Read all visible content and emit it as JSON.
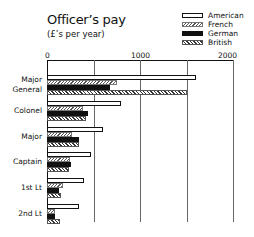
{
  "chart_data": {
    "type": "bar",
    "orientation": "horizontal",
    "subtitle": "(£'s per year)",
    "xlabel": "",
    "ylabel": "",
    "xlim": [
      0,
      2000
    ],
    "xticks": [
      0,
      1000,
      2000
    ],
    "x_gridlines": [
      500,
      1000,
      1500,
      2000
    ],
    "legend_position": "top-right",
    "categories": [
      "Major General",
      "Colonel",
      "Major",
      "Captain",
      "1st Lt",
      "2nd Lt"
    ],
    "series": [
      {
        "name": "American",
        "fill": "white",
        "values": [
          1600,
          800,
          600,
          470,
          400,
          340
        ]
      },
      {
        "name": "French",
        "fill": "light-hatch",
        "values": [
          750,
          390,
          270,
          250,
          170,
          90
        ]
      },
      {
        "name": "German",
        "fill": "black",
        "values": [
          680,
          440,
          340,
          260,
          130,
          90
        ]
      },
      {
        "name": "British",
        "fill": "dark-hatch",
        "values": [
          1500,
          420,
          340,
          240,
          150,
          140
        ]
      }
    ]
  },
  "labels": {
    "title": "Officer’s pay",
    "subtitle": "(£’s per year)",
    "ticks": [
      "0",
      "1000",
      "2000"
    ],
    "categories": [
      "Major\nGeneral",
      "Colonel",
      "Major",
      "Captain",
      "1st Lt",
      "2nd Lt"
    ],
    "legend": [
      "American",
      "French",
      "German",
      "British"
    ]
  }
}
